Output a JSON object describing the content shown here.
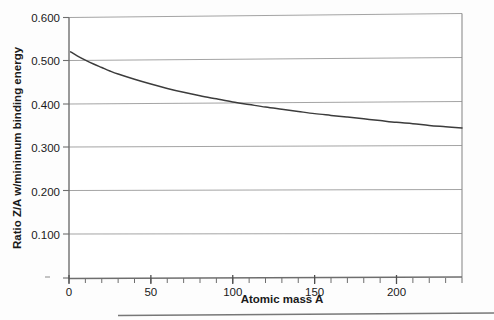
{
  "chart_data": {
    "type": "line",
    "title": "",
    "xlabel": "Atomic mass A",
    "ylabel": "Ratio Z/A w/minimum binding energy",
    "xlim": [
      0,
      240
    ],
    "ylim": [
      0.0,
      0.6
    ],
    "grid": true,
    "legend": "none",
    "xticks": [
      0,
      50,
      100,
      150,
      200
    ],
    "xtick_labels": [
      "0",
      "50",
      "100",
      "150",
      "200"
    ],
    "xminor_step": 10,
    "yticks": [
      0.1,
      0.2,
      0.3,
      0.4,
      0.5,
      0.6
    ],
    "ytick_labels": [
      "0.100",
      "0.200",
      "0.300",
      "0.400",
      "0.500",
      "0.600"
    ],
    "series": [
      {
        "name": "Z/A at minimum binding energy",
        "x": [
          1,
          5,
          10,
          15,
          20,
          25,
          30,
          40,
          50,
          60,
          70,
          80,
          90,
          100,
          110,
          120,
          130,
          140,
          150,
          160,
          170,
          180,
          190,
          200,
          210,
          220,
          230,
          240
        ],
        "y": [
          0.521,
          0.512,
          0.502,
          0.493,
          0.485,
          0.477,
          0.47,
          0.458,
          0.447,
          0.437,
          0.428,
          0.42,
          0.413,
          0.406,
          0.4,
          0.394,
          0.389,
          0.384,
          0.379,
          0.375,
          0.371,
          0.367,
          0.363,
          0.359,
          0.356,
          0.352,
          0.349,
          0.346
        ]
      }
    ]
  },
  "axes": {
    "y_axis_title": "Ratio Z/A w/minimum binding energy",
    "x_axis_title": "Atomic mass A",
    "y_labels": [
      "0.600",
      "0.500",
      "0.400",
      "0.300",
      "0.200",
      "0.100"
    ],
    "x_labels": [
      "0",
      "50",
      "100",
      "150",
      "200"
    ]
  },
  "colors": {
    "curve": "#3c3c3c",
    "grid": "#9a9a9a",
    "axis": "#6e6e6e",
    "text": "#1a1a1a",
    "background": "#ffffff"
  }
}
